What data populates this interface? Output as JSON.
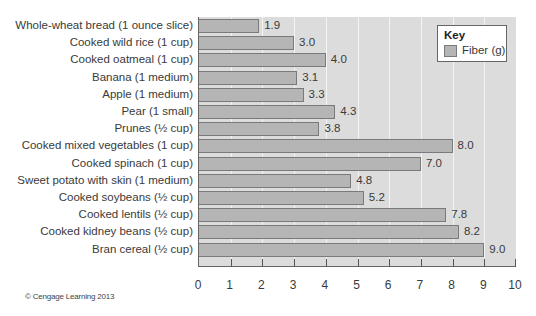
{
  "chart_data": {
    "type": "bar",
    "orientation": "horizontal",
    "title": "",
    "xlabel": "",
    "ylabel": "",
    "xlim": [
      0,
      10
    ],
    "x_ticks": [
      "0",
      "1",
      "2",
      "3",
      "4",
      "5",
      "6",
      "7",
      "8",
      "9",
      "10"
    ],
    "grid": true,
    "legend": {
      "title": "Key",
      "position": "top-right",
      "entries": [
        "Fiber (g)"
      ]
    },
    "categories": [
      "Whole-wheat bread (1 ounce slice)",
      "Cooked wild rice (1 cup)",
      "Cooked oatmeal (1 cup)",
      "Banana (1 medium)",
      "Apple (1 medium)",
      "Pear (1 small)",
      "Prunes (½ cup)",
      "Cooked mixed vegetables (1 cup)",
      "Cooked spinach (1 cup)",
      "Sweet potato with skin (1 medium)",
      "Cooked soybeans (½ cup)",
      "Cooked lentils (½ cup)",
      "Cooked kidney beans (½ cup)",
      "Bran cereal (½ cup)"
    ],
    "series": [
      {
        "name": "Fiber (g)",
        "values": [
          1.9,
          3.0,
          4.0,
          3.1,
          3.3,
          4.3,
          3.8,
          8.0,
          7.0,
          4.8,
          5.2,
          7.8,
          8.2,
          9.0
        ],
        "value_labels": [
          "1.9",
          "3.0",
          "4.0",
          "3.1",
          "3.3",
          "4.3",
          "3.8",
          "8.0",
          "7.0",
          "4.8",
          "5.2",
          "7.8",
          "8.2",
          "9.0"
        ]
      }
    ]
  },
  "key": {
    "title": "Key",
    "entry_label": "Fiber (g)"
  },
  "colors": {
    "bar_fill": "#b5b5b5",
    "bar_border": "#7a7a7a",
    "plot_bg": "#dcdcdc",
    "grid": "#f4f4f4"
  },
  "credit": "© Cengage Learning 2013"
}
